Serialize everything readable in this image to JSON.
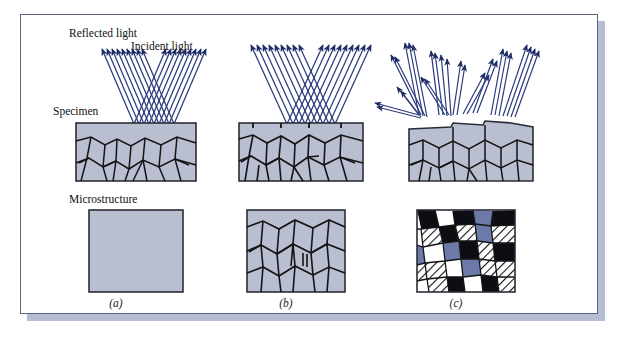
{
  "figure": {
    "domain_title": "Reflected light microscopy of polished and etched metal specimens",
    "frame_border_color": "#5a6484",
    "frame_shadow_color": "#b6bdd2",
    "background_color": "#ffffff"
  },
  "colors": {
    "ray_blue": "#2a3a7c",
    "ray_blue_dark": "#1d2b63",
    "specimen_fill": "#b9bed1",
    "specimen_fill_light": "#c2c6d8",
    "grain_boundary": "#141414",
    "block_border": "#2c2c38",
    "grain_black": "#0d0d14",
    "grain_blue": "#6b7aa8",
    "grain_white": "#ffffff",
    "hatch_line": "#16161c",
    "text": "#111111"
  },
  "labels": {
    "reflected_light": "Reflected light",
    "incident_light": "Incident light",
    "specimen": "Specimen",
    "microstructure": "Microstructure"
  },
  "panels": [
    {
      "id": "a",
      "caption": "(a)",
      "description": "Polished, unetched specimen: incident rays reflect uniformly, microstructure appears featureless",
      "microstructure_type": "uniform",
      "surface_type": "flat",
      "ray_count_incident": 9,
      "ray_count_reflected": 9
    },
    {
      "id": "b",
      "caption": "(b)",
      "description": "Etched specimen with grooved grain boundaries: rays scatter at boundaries revealing grain outlines",
      "microstructure_type": "grain-outlines",
      "surface_type": "grooved-boundaries",
      "ray_count_incident": 9,
      "ray_count_reflected": 9
    },
    {
      "id": "c",
      "caption": "(c)",
      "description": "Etched specimen with differently oriented grains: texture varies so grains reflect at different angles and different brightnesses",
      "microstructure_type": "contrast-grains",
      "surface_type": "stepped-grains",
      "ray_count_incident": 12,
      "ray_count_reflected": 12
    }
  ],
  "grain_fill_legend": {
    "black": "strongly etched grain (dark)",
    "blue": "moderately etched grain",
    "white": "lightly etched grain (bright)",
    "hatched": "intermediate orientation grain"
  }
}
